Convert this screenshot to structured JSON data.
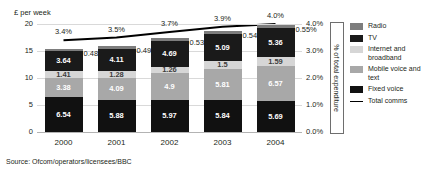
{
  "axis_title_left": "£ per week",
  "axis_title_right": "% of total expenditure",
  "source": "Source: Ofcom/operators/licensees/BBC",
  "legend": {
    "items": [
      {
        "label": "Radio",
        "color": "#7d7d7d",
        "type": "swatch"
      },
      {
        "label": "TV",
        "color": "#1a1a1a",
        "type": "swatch"
      },
      {
        "label": "Internet and broadband",
        "color": "#d6d6d6",
        "type": "swatch"
      },
      {
        "label": "Mobile voice and text",
        "color": "#a8a8a8",
        "type": "swatch"
      },
      {
        "label": "Fixed voice",
        "color": "#111111",
        "type": "swatch"
      },
      {
        "label": "Total comms",
        "color": "#000000",
        "type": "line"
      }
    ]
  },
  "chart_data": {
    "type": "bar",
    "title": "",
    "categories": [
      "2000",
      "2001",
      "2002",
      "2003",
      "2004"
    ],
    "xlabel": "",
    "ylabel": "£ per week",
    "ylim": [
      0,
      20
    ],
    "yticks": [
      "0",
      "5",
      "10",
      "15",
      "20"
    ],
    "y2label": "% of total expenditure",
    "y2lim": [
      0,
      4.0
    ],
    "y2ticks": [
      "0.0%",
      "1.0%",
      "2.0%",
      "3.0%",
      "4.0%"
    ],
    "grid": true,
    "stacked": true,
    "legend_position": "right",
    "series": [
      {
        "name": "Fixed voice",
        "color": "#111111",
        "values": [
          6.54,
          5.88,
          5.97,
          5.84,
          5.69
        ]
      },
      {
        "name": "Mobile voice and text",
        "color": "#a8a8a8",
        "values": [
          3.38,
          4.09,
          4.9,
          5.81,
          6.57
        ]
      },
      {
        "name": "Internet and broadband",
        "color": "#d6d6d6",
        "values": [
          1.41,
          1.28,
          1.26,
          1.5,
          1.59
        ]
      },
      {
        "name": "TV",
        "color": "#1a1a1a",
        "values": [
          3.64,
          4.11,
          4.69,
          5.09,
          5.36
        ]
      },
      {
        "name": "Radio",
        "color": "#7d7d7d",
        "values": [
          0.48,
          0.49,
          0.53,
          0.54,
          0.55
        ]
      }
    ],
    "radio_callouts": [
      "0.48",
      "0.49",
      "0.53",
      "0.54",
      "0.55%"
    ],
    "line_series": {
      "name": "Total comms",
      "color": "#000000",
      "values": [
        3.4,
        3.5,
        3.7,
        3.9,
        4.0
      ],
      "labels": [
        "3.4%",
        "3.5%",
        "3.7%",
        "3.9%",
        "4.0%"
      ]
    }
  }
}
